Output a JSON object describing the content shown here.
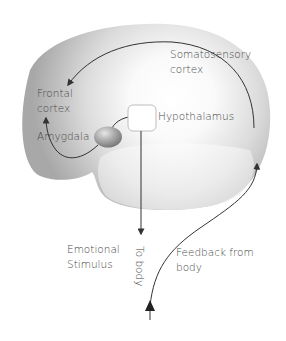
{
  "diagram": {
    "type": "emotion pathway diagram (James-Lange style loop)",
    "colors": {
      "background": "#ffffff",
      "brain_edge": "#a9a9a9",
      "brain_center": "#ffffff",
      "arrow": "#333333",
      "text": "#4a4a4a",
      "box_stroke": "#bdbdbd",
      "amygdala": "#9a9a9a"
    },
    "labels": {
      "somatosensory_line1": "Somatosensory",
      "somatosensory_line2": "cortex",
      "frontal_line1": "Frontal",
      "frontal_line2": "cortex",
      "amygdala": "Amygdala",
      "hypothalamus": "Hypothalamus",
      "emotional_line1": "Emotional",
      "emotional_line2": "Stimulus",
      "to_body": "To body",
      "feedback_line1": "Feedback from",
      "feedback_line2": "body"
    },
    "connections": [
      {
        "from": "Somatosensory cortex",
        "to": "Frontal cortex"
      },
      {
        "from": "Amygdala",
        "to": "Frontal cortex"
      },
      {
        "from": "Amygdala",
        "to": "Hypothalamus"
      },
      {
        "from": "Hypothalamus",
        "to": "Body",
        "label": "To body"
      },
      {
        "from": "Body",
        "to": "Somatosensory cortex",
        "label": "Feedback from body"
      }
    ]
  }
}
